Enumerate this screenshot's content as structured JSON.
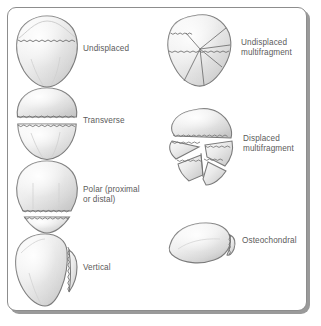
{
  "figure": {
    "style": {
      "frame_border_color": "#8d8d8d",
      "frame_shadow_color": "#9a9a9a",
      "background": "#ffffff",
      "label_color": "#5b5b5b",
      "bone_fill_light": "#f2f2f2",
      "bone_fill_mid": "#d9d9d9",
      "bone_fill_dark": "#b9b9b9",
      "bone_outline": "#7a7a7a",
      "fracture_line_color": "#6e6e6e",
      "fracture_gap_color": "#ffffff"
    },
    "columns": [
      {
        "name": "left-column",
        "items": [
          {
            "id": "undisplaced",
            "label": "Undisplaced",
            "fracture": "transverse-hairline-upper"
          },
          {
            "id": "transverse",
            "label": "Transverse",
            "fracture": "transverse-displaced-gap"
          },
          {
            "id": "polar",
            "label": "Polar (proximal\nor distal)",
            "fracture": "distal-pole-transverse"
          },
          {
            "id": "vertical",
            "label": "Vertical",
            "fracture": "vertical-lateral"
          }
        ]
      },
      {
        "name": "right-column",
        "items": [
          {
            "id": "undisplaced-multifragment",
            "label": "Undisplaced\nmultifragment",
            "fracture": "stellate-undisplaced"
          },
          {
            "id": "displaced-multifragment",
            "label": "Displaced\nmultifragment",
            "fracture": "stellate-displaced"
          },
          {
            "id": "osteochondral",
            "label": "Osteochondral",
            "fracture": "chondral-flake"
          }
        ]
      }
    ]
  }
}
